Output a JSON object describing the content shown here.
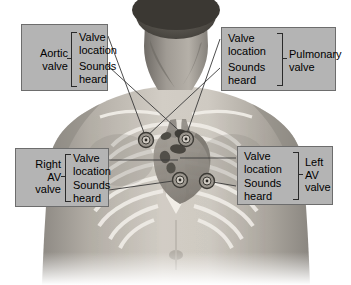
{
  "figure": {
    "type": "anatomical-diagram",
    "background_color": "#ffffff",
    "box_fill_color": "#b4b4b4",
    "box_border_color": "#6d6d6d",
    "leader_line_color": "#3a3a3a",
    "skin_color": "#b9b4ac",
    "rib_color": "#e6e3dc",
    "heart_color": "#8f8a83",
    "valve_marker_color": "#4a4740"
  },
  "callouts": {
    "aortic": {
      "valve_label": "Aortic\nvalve",
      "items": [
        "Valve\nlocation",
        "Sounds\nheard"
      ],
      "label_side": "left"
    },
    "pulmonary": {
      "valve_label": "Pulmonary\nvalve",
      "items": [
        "Valve\nlocation",
        "Sounds\nheard"
      ],
      "label_side": "right"
    },
    "right_av": {
      "valve_label": "Right\nAV\nvalve",
      "items": [
        "Valve\nlocation",
        "Sounds\nheard"
      ],
      "label_side": "left"
    },
    "left_av": {
      "valve_label": "Left\nAV\nvalve",
      "items": [
        "Valve\nlocation",
        "Sounds\nheard"
      ],
      "label_side": "right"
    }
  },
  "markers": [
    {
      "name": "aortic-valve-location-marker",
      "x": 146,
      "y": 140
    },
    {
      "name": "pulmonary-valve-location-marker",
      "x": 186,
      "y": 139
    },
    {
      "name": "right-av-valve-location-marker",
      "x": 180,
      "y": 180
    },
    {
      "name": "left-av-valve-location-marker",
      "x": 207,
      "y": 181
    }
  ]
}
